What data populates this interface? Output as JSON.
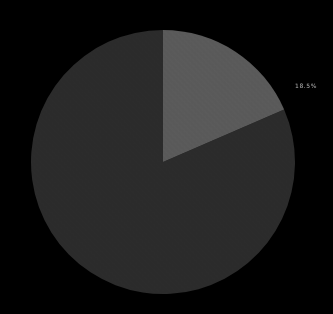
{
  "figure": {
    "background_color": "#000000",
    "width": 333,
    "height": 314
  },
  "chart_data": {
    "type": "pie",
    "title": "",
    "subtitle": "",
    "xlabel": "",
    "ylabel": "",
    "grid": false,
    "legend": false,
    "legend_position": "none",
    "labels": [
      "Slice 1",
      "Slice 2"
    ],
    "values": [
      81.5,
      18.5
    ],
    "colors": [
      "#2b2b2b",
      "#5a5a5a"
    ],
    "start_angle_deg": 90,
    "direction": "clockwise",
    "center": [
      163,
      162
    ],
    "radius": 132,
    "annotations": [
      {
        "name": "wedge-percent-label",
        "text": "18.5%",
        "x": 295,
        "y": 83,
        "color": "#b4b4b4",
        "slice_index": 1
      }
    ]
  }
}
